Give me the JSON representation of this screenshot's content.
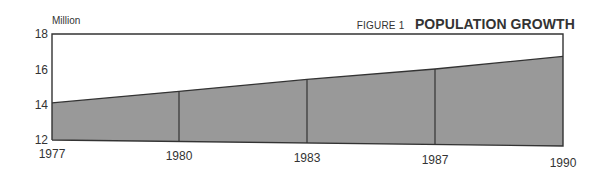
{
  "figure": {
    "number_label": "FIGURE 1",
    "title": "POPULATION GROWTH",
    "unit_label": "Million"
  },
  "colors": {
    "fill": "#999999",
    "line": "#333333",
    "frame": "#333333",
    "background": "#ffffff"
  },
  "chart_data": {
    "type": "area",
    "title": "POPULATION GROWTH",
    "subtitle": "FIGURE 1",
    "xlabel": "",
    "ylabel": "Million",
    "x": [
      "1977",
      "1980",
      "1983",
      "1987",
      "1990"
    ],
    "categories": [
      "1977",
      "1980",
      "1983",
      "1987",
      "1990"
    ],
    "series": [
      {
        "name": "Population",
        "values": [
          14.1,
          14.8,
          15.5,
          16.1,
          16.8
        ]
      }
    ],
    "values": [
      14.1,
      14.8,
      15.5,
      16.1,
      16.8
    ],
    "ylim": [
      12,
      18
    ],
    "yticks": [
      "12",
      "14",
      "16",
      "18"
    ],
    "xticks": [
      "1977",
      "1980",
      "1983",
      "1987",
      "1990"
    ],
    "grid": false,
    "vertical_dividers_at_x": [
      "1980",
      "1983",
      "1987"
    ],
    "legend": null
  }
}
